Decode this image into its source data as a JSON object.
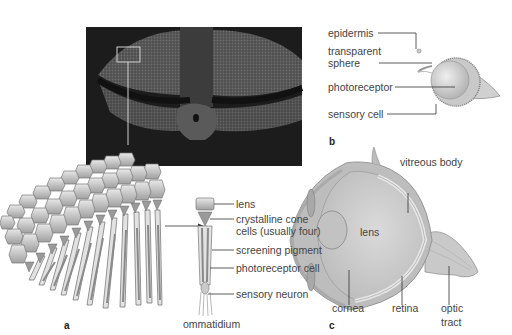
{
  "figure": {
    "panels": [
      {
        "id": "a",
        "letter": "a",
        "subject": "compound-eye",
        "photo": {
          "description": "insect head with compound eyes",
          "highlight_box": true
        },
        "labels": {
          "lens": "lens",
          "crystalline_cone_1": "crystalline cone",
          "crystalline_cone_2": "cells (usually four)",
          "screening_pigment": "screening pigment",
          "photoreceptor_cell": "photoreceptor cell",
          "sensory_neuron": "sensory neuron",
          "caption": "ommatidium"
        }
      },
      {
        "id": "b",
        "letter": "b",
        "subject": "simple-eye",
        "labels": {
          "epidermis": "epidermis",
          "transparent_sphere_1": "transparent",
          "transparent_sphere_2": "sphere",
          "photoreceptor": "photoreceptor",
          "sensory_cell": "sensory cell"
        }
      },
      {
        "id": "c",
        "letter": "c",
        "subject": "camera-eye",
        "labels": {
          "vitreous_body": "vitreous body",
          "lens": "lens",
          "cornea": "cornea",
          "retina": "retina",
          "optic_tract_1": "optic",
          "optic_tract_2": "tract"
        }
      }
    ],
    "colors": {
      "background": "#ffffff",
      "photo_dark": "#1e1e1e",
      "diagram_gray": "#b8b8b8",
      "diagram_light": "#dcdcdc",
      "leader_line": "#333333",
      "text": "#444444"
    }
  }
}
